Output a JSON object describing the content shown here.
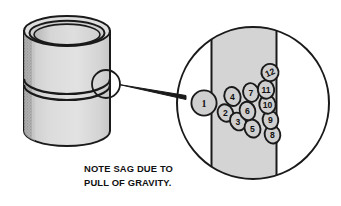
{
  "figure": {
    "background_color": "#ffffff",
    "line_color": "#1a1a1a",
    "metal_fill": "#d8d8d8",
    "bead_fill": "#cfcfcf",
    "shadow_fill": "#8c8c8c"
  },
  "caption": {
    "line1": "NOTE SAG DUE TO",
    "line2": "PULL OF GRAVITY."
  },
  "pipe": {
    "name": "welded-pipe",
    "seam_label": "weld-seam-ring",
    "callout_label": "detail-callout-circle"
  },
  "detail": {
    "name": "magnified-detail-view",
    "wall_band_label": "pipe-wall-section"
  },
  "root_pass": {
    "number": "1"
  },
  "beads": [
    {
      "number": "2",
      "cx": 225.5,
      "cy": 113.0,
      "rx": 7.6,
      "ry": 9.0,
      "rot": -28
    },
    {
      "number": "3",
      "cx": 238.0,
      "cy": 121.5,
      "rx": 7.6,
      "ry": 9.2,
      "rot": -28
    },
    {
      "number": "4",
      "cx": 232.5,
      "cy": 96.5,
      "rx": 8.0,
      "ry": 9.6,
      "rot": -20
    },
    {
      "number": "5",
      "cx": 252.5,
      "cy": 128.5,
      "rx": 7.8,
      "ry": 9.2,
      "rot": -22
    },
    {
      "number": "6",
      "cx": 247.5,
      "cy": 111.0,
      "rx": 7.8,
      "ry": 9.4,
      "rot": -16
    },
    {
      "number": "7",
      "cx": 251.0,
      "cy": 92.5,
      "rx": 7.8,
      "ry": 9.4,
      "rot": -14
    },
    {
      "number": "8",
      "cx": 272.5,
      "cy": 134.5,
      "rx": 7.8,
      "ry": 9.0,
      "rot": -14
    },
    {
      "number": "9",
      "cx": 270.5,
      "cy": 120.0,
      "rx": 7.8,
      "ry": 9.2,
      "rot": -10
    },
    {
      "number": "10",
      "cx": 267.5,
      "cy": 104.5,
      "rx": 8.2,
      "ry": 9.2,
      "rot": -8
    },
    {
      "number": "11",
      "cx": 266.0,
      "cy": 89.5,
      "rx": 8.2,
      "ry": 9.2,
      "rot": -8
    },
    {
      "number": "12",
      "cx": 270.0,
      "cy": 72.5,
      "rx": 8.6,
      "ry": 8.6,
      "rot": -30
    }
  ]
}
